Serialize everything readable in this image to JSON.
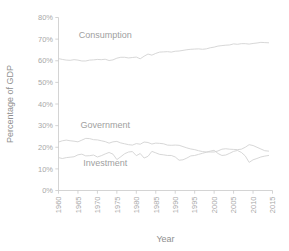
{
  "chart_data": {
    "type": "line",
    "title": "",
    "xlabel": "Year",
    "ylabel": "Percentage of GDP",
    "xlim": [
      1960,
      2015
    ],
    "ylim": [
      0,
      80
    ],
    "grid": false,
    "legend_position": "inline-annotations",
    "xticks": [
      1960,
      1965,
      1970,
      1975,
      1980,
      1985,
      1990,
      1995,
      2000,
      2005,
      2010,
      2015
    ],
    "xtick_labels": [
      "1960",
      "1965",
      "1970",
      "1975",
      "1980",
      "1985",
      "1990",
      "1995",
      "2000",
      "2005",
      "2010",
      "2015"
    ],
    "yticks": [
      0,
      10,
      20,
      30,
      40,
      50,
      60,
      70,
      80
    ],
    "ytick_labels": [
      "0%",
      "10%",
      "20%",
      "30%",
      "40%",
      "50%",
      "60%",
      "70%",
      "80%"
    ],
    "line_color": "#d2d2d2",
    "x": [
      1960,
      1961,
      1962,
      1963,
      1964,
      1965,
      1966,
      1967,
      1968,
      1969,
      1970,
      1971,
      1972,
      1973,
      1974,
      1975,
      1976,
      1977,
      1978,
      1979,
      1980,
      1981,
      1982,
      1983,
      1984,
      1985,
      1986,
      1987,
      1988,
      1989,
      1990,
      1991,
      1992,
      1993,
      1994,
      1995,
      1996,
      1997,
      1998,
      1999,
      2000,
      2001,
      2002,
      2003,
      2004,
      2005,
      2006,
      2007,
      2008,
      2009,
      2010,
      2011,
      2012,
      2013,
      2014
    ],
    "series": [
      {
        "name": "Consumption",
        "label": "Consumption",
        "values": [
          61.0,
          60.6,
          60.3,
          60.2,
          60.5,
          60.3,
          59.9,
          59.9,
          60.3,
          60.4,
          60.6,
          60.5,
          60.7,
          60.1,
          60.4,
          61.2,
          61.6,
          61.6,
          61.3,
          61.5,
          61.7,
          60.9,
          62.1,
          63.1,
          62.6,
          63.4,
          64.0,
          64.1,
          64.2,
          64.0,
          64.4,
          64.5,
          64.8,
          65.1,
          65.3,
          65.4,
          65.5,
          65.3,
          65.5,
          66.0,
          66.3,
          66.8,
          67.0,
          67.2,
          67.3,
          67.8,
          67.6,
          67.9,
          67.9,
          67.7,
          68.0,
          68.2,
          68.5,
          68.4,
          68.3
        ]
      },
      {
        "name": "Government",
        "label": "Government",
        "values": [
          22.4,
          23.0,
          23.3,
          23.0,
          22.8,
          22.5,
          23.3,
          24.1,
          24.0,
          23.5,
          23.4,
          23.0,
          22.6,
          21.9,
          22.5,
          22.7,
          22.0,
          21.6,
          21.2,
          21.0,
          21.7,
          21.4,
          22.4,
          22.2,
          21.5,
          21.9,
          21.8,
          21.6,
          21.0,
          20.9,
          21.0,
          20.9,
          20.3,
          19.7,
          19.2,
          18.9,
          18.4,
          18.0,
          17.8,
          17.8,
          17.8,
          18.3,
          19.1,
          19.3,
          19.1,
          19.0,
          18.9,
          19.1,
          20.0,
          21.2,
          20.8,
          20.0,
          19.2,
          18.4,
          18.2
        ]
      },
      {
        "name": "Investment",
        "label": "Investment",
        "values": [
          15.2,
          14.8,
          15.2,
          15.4,
          15.6,
          16.5,
          16.8,
          16.0,
          16.1,
          16.4,
          15.5,
          16.1,
          16.9,
          17.6,
          16.8,
          14.3,
          15.6,
          17.0,
          17.8,
          18.0,
          16.1,
          17.1,
          15.0,
          15.8,
          18.1,
          17.4,
          16.7,
          16.5,
          16.2,
          16.2,
          15.5,
          14.0,
          14.2,
          15.0,
          16.0,
          16.2,
          16.7,
          17.2,
          17.7,
          18.2,
          18.6,
          17.1,
          16.2,
          16.4,
          17.2,
          18.1,
          18.5,
          17.6,
          16.0,
          13.0,
          14.2,
          14.8,
          15.5,
          15.9,
          16.2
        ]
      }
    ],
    "annotations": [
      {
        "text": "Consumption",
        "x": 1972,
        "y": 70.5
      },
      {
        "text": "Government",
        "x": 1972,
        "y": 29.0
      },
      {
        "text": "Investment",
        "x": 1972,
        "y": 11.5
      }
    ]
  }
}
